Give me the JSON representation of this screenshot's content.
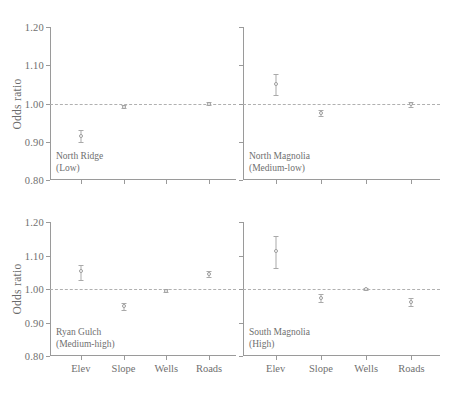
{
  "chart_data": {
    "type": "scatter",
    "title": "",
    "ylabel": "Odds ratio",
    "xlabel": "",
    "ylim": [
      0.8,
      1.2
    ],
    "ytick_labels": [
      "1.20",
      "1.10",
      "1.00",
      "0.90",
      "0.80"
    ],
    "ytick_values": [
      1.2,
      1.1,
      1.0,
      0.9,
      0.8
    ],
    "categories": [
      "Elev",
      "Slope",
      "Wells",
      "Roads"
    ],
    "grid": false,
    "legend": "none",
    "reference_line": 1.0,
    "marker_style": "open-circle-with-error-bars",
    "panels": [
      {
        "id": "north-ridge",
        "name": "North Ridge",
        "sublabel": "(Low)",
        "position": "top-left",
        "show_ylabel": true,
        "show_ytick_labels": true,
        "show_xtick_labels": false,
        "values": [
          0.915,
          0.992,
          null,
          1.0
        ],
        "err_low": [
          0.9,
          0.987,
          null,
          0.996
        ],
        "err_high": [
          0.93,
          0.997,
          null,
          1.004
        ]
      },
      {
        "id": "north-magnolia",
        "name": "North Magnolia",
        "sublabel": "(Medium-low)",
        "position": "top-right",
        "show_ylabel": false,
        "show_ytick_labels": false,
        "show_xtick_labels": false,
        "values": [
          1.052,
          0.975,
          null,
          0.998
        ],
        "err_low": [
          1.022,
          0.968,
          null,
          0.992
        ],
        "err_high": [
          1.078,
          0.983,
          null,
          1.004
        ]
      },
      {
        "id": "ryan-gulch",
        "name": "Ryan Gulch",
        "sublabel": "(Medium-high)",
        "position": "bottom-left",
        "show_ylabel": true,
        "show_ytick_labels": true,
        "show_xtick_labels": true,
        "values": [
          1.053,
          0.948,
          0.995,
          1.045
        ],
        "err_low": [
          1.028,
          0.938,
          0.991,
          1.036
        ],
        "err_high": [
          1.072,
          0.958,
          0.999,
          1.054
        ]
      },
      {
        "id": "south-magnolia",
        "name": "South Magnolia",
        "sublabel": "(High)",
        "position": "bottom-right",
        "show_ylabel": false,
        "show_ytick_labels": false,
        "show_xtick_labels": true,
        "values": [
          1.112,
          0.972,
          1.0,
          0.962
        ],
        "err_low": [
          1.062,
          0.962,
          0.998,
          0.95
        ],
        "err_high": [
          1.158,
          0.984,
          1.002,
          0.974
        ]
      }
    ],
    "colors": {
      "axis": "#9a9a9a",
      "marker": "#9d9d9d",
      "reference_line": "#b0b0b0",
      "text": "#6f6f6f",
      "background": "#ffffff"
    }
  }
}
